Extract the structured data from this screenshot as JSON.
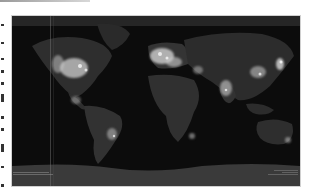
{
  "image": {
    "subject": "Earth at night — world map of city lights",
    "colors": {
      "ocean": "#0c0c0c",
      "land": "#2e2e2e",
      "lights": "#d9d9d9",
      "antarctica": "#3a3a3a"
    }
  },
  "captions": {
    "left": [
      "",
      ""
    ],
    "right": [
      "",
      "",
      ""
    ]
  }
}
